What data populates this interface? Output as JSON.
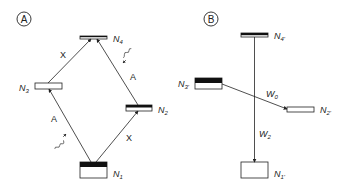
{
  "panels": [
    {
      "id": "A",
      "label": "A",
      "levels": [
        {
          "name": "N4",
          "sub": "4"
        },
        {
          "name": "N3",
          "sub": "3"
        },
        {
          "name": "N2",
          "sub": "2"
        },
        {
          "name": "N1",
          "sub": "1"
        }
      ],
      "transitions": [
        {
          "from": "N3",
          "to": "N4",
          "label": "X"
        },
        {
          "from": "N2",
          "to": "N4",
          "label": "A"
        },
        {
          "from": "N1",
          "to": "N3",
          "label": "A"
        },
        {
          "from": "N1",
          "to": "N2",
          "label": "X"
        }
      ]
    },
    {
      "id": "B",
      "label": "B",
      "levels": [
        {
          "name": "N4'",
          "sub": "4'"
        },
        {
          "name": "N3'",
          "sub": "3'"
        },
        {
          "name": "N2'",
          "sub": "2'"
        },
        {
          "name": "N1'",
          "sub": "1'"
        }
      ],
      "transitions": [
        {
          "from": "N3'",
          "to": "N2'",
          "label": "W",
          "sub": "0"
        },
        {
          "from": "N4'",
          "to": "N1'",
          "label": "W",
          "sub": "2"
        }
      ]
    }
  ],
  "colors": {
    "line": "#222222",
    "fill": "#111111",
    "background": "#ffffff"
  }
}
